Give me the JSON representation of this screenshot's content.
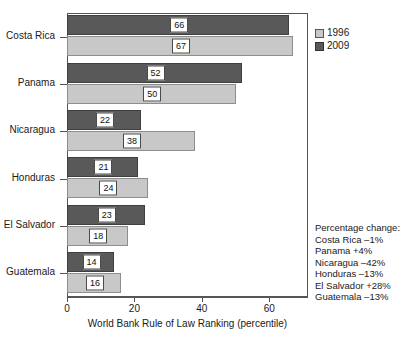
{
  "chart_data": {
    "type": "bar",
    "orientation": "horizontal",
    "title": "",
    "xlabel": "World Bank Rule of Law Ranking (percentile)",
    "ylabel": "",
    "xlim": [
      0,
      71.5
    ],
    "xticks": [
      0,
      20,
      40,
      60
    ],
    "xtick_labels": [
      "0",
      "20",
      "40",
      "60"
    ],
    "grid": false,
    "legend_position": "top-right-outside",
    "categories": [
      "Costa Rica",
      "Panama",
      "Nicaragua",
      "Honduras",
      "El Salvador",
      "Guatemala"
    ],
    "series": [
      {
        "name": "2009",
        "color": "#595959",
        "values": [
          66,
          52,
          22,
          21,
          23,
          14
        ]
      },
      {
        "name": "1996",
        "color": "#c8c8c8",
        "values": [
          67,
          50,
          38,
          24,
          18,
          16
        ]
      }
    ],
    "annotations": {
      "heading": "Percentage change:",
      "lines": [
        "Costa Rica –1%",
        "Panama +4%",
        "Nicaragua –42%",
        "Honduras –13%",
        "El Salvador +28%",
        "Guatemala –13%"
      ]
    }
  },
  "colors": {
    "series_1996": "#c8c8c8",
    "series_2009": "#595959",
    "axis": "#555555",
    "label_box_background": "#ffffff",
    "label_box_border": "#4a4a4a",
    "text": "#1a1a1a"
  }
}
